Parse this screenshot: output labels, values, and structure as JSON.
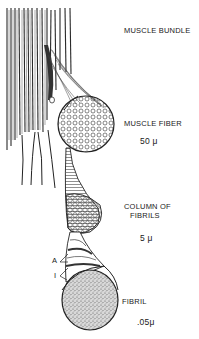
{
  "figure": {
    "type": "anatomical-illustration",
    "levels": [
      {
        "id": "muscle-bundle",
        "label": "MUSCLE BUNDLE",
        "scale": ""
      },
      {
        "id": "muscle-fiber",
        "label": "MUSCLE FIBER",
        "scale": "50 μ"
      },
      {
        "id": "column-of-fibrils",
        "label_line1": "COLUMN OF",
        "label_line2": "FIBRILS",
        "scale": "5 μ"
      },
      {
        "id": "fibril",
        "label": "FIBRIL",
        "scale": ".05μ"
      }
    ],
    "band_labels": {
      "a_band": "A",
      "i_band": "I"
    },
    "colors": {
      "ink": "#1a1a1a",
      "paper": "#ffffff",
      "stipple": "#555555"
    }
  }
}
